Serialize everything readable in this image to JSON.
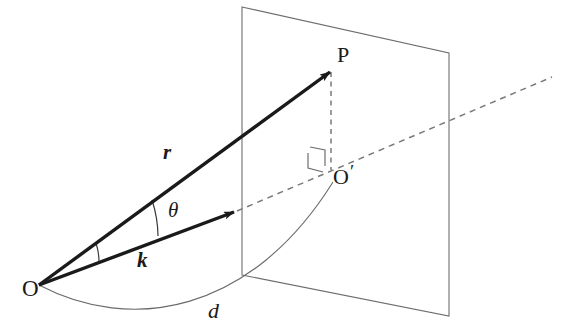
{
  "figure": {
    "kind": "3d-geometry-diagram",
    "background_color": "#ffffff",
    "stroke_color_solid": "#1a1a1a",
    "stroke_color_plane": "#6e6e6e",
    "stroke_color_dashed": "#7a7a7a",
    "stroke_color_arc": "#6a6a6a"
  },
  "labels": {
    "origin": "O",
    "point_p": "P",
    "foot_o_prime": "O",
    "foot_o_prime_mark": "′",
    "vector_r": "r",
    "vector_k": "k",
    "angle_theta": "θ",
    "distance_d": "d"
  },
  "geometry": {
    "origin_point": {
      "x": 39,
      "y": 285
    },
    "point_p": {
      "x": 332,
      "y": 70
    },
    "k_arrow_tip": {
      "x": 237,
      "y": 211
    },
    "foot_o_prime": {
      "x": 331,
      "y": 168
    },
    "dashed_ray_end": {
      "x": 552,
      "y": 77
    },
    "plane_corners": [
      {
        "x": 242,
        "y": 7
      },
      {
        "x": 449,
        "y": 53
      },
      {
        "x": 449,
        "y": 316
      },
      {
        "x": 242,
        "y": 275
      }
    ],
    "right_angle_marker": {
      "x": 308,
      "y": 148,
      "size": 14
    },
    "angle_arc_radius": 62,
    "arc_d_start": {
      "x": 39,
      "y": 285
    },
    "arc_d_end": {
      "x": 332,
      "y": 183
    }
  },
  "elements": [
    {
      "name": "projection-plane",
      "type": "quadrilateral"
    },
    {
      "name": "vector-r-arrow",
      "type": "arrow",
      "from": "origin",
      "to": "point_p"
    },
    {
      "name": "vector-k-arrow",
      "type": "arrow",
      "from": "origin",
      "to": "k_arrow_tip"
    },
    {
      "name": "k-extension-dashed-ray",
      "type": "dashed-line"
    },
    {
      "name": "p-to-oprime-dashed-line",
      "type": "dashed-line"
    },
    {
      "name": "angle-theta-arc",
      "type": "arc"
    },
    {
      "name": "distance-d-arc",
      "type": "arc"
    },
    {
      "name": "right-angle-marker",
      "type": "square-marker"
    }
  ]
}
